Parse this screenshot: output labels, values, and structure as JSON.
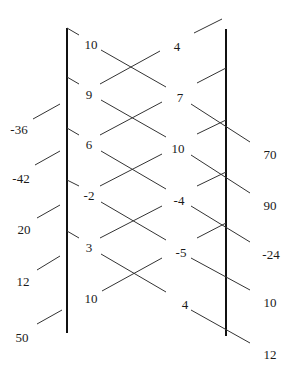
{
  "diagram": {
    "type": "number-chain-crossing",
    "colors": {
      "axis": "#111111",
      "segment": "#333333",
      "text": "#1a1a1a"
    },
    "left_axis": {
      "x": 67,
      "y1": 28,
      "y2": 333
    },
    "right_axis": {
      "x": 226,
      "y1": 29,
      "y2": 336
    },
    "left_inner_labels": [
      {
        "text": "10",
        "x": 91,
        "y": 46
      },
      {
        "text": "9",
        "x": 89,
        "y": 96
      },
      {
        "text": "6",
        "x": 89,
        "y": 146
      },
      {
        "text": "-2",
        "x": 89,
        "y": 197
      },
      {
        "text": "3",
        "x": 89,
        "y": 249
      },
      {
        "text": "10",
        "x": 91,
        "y": 300
      }
    ],
    "right_inner_labels": [
      {
        "text": "4",
        "x": 177,
        "y": 48
      },
      {
        "text": "7",
        "x": 180,
        "y": 99
      },
      {
        "text": "10",
        "x": 178,
        "y": 150
      },
      {
        "text": "-4",
        "x": 179,
        "y": 202
      },
      {
        "text": "-5",
        "x": 181,
        "y": 254
      },
      {
        "text": "4",
        "x": 185,
        "y": 306
      }
    ],
    "left_outer_labels": [
      {
        "text": "-36",
        "x": 19,
        "y": 131
      },
      {
        "text": "-42",
        "x": 21,
        "y": 180
      },
      {
        "text": "20",
        "x": 24,
        "y": 231
      },
      {
        "text": "12",
        "x": 23,
        "y": 283
      },
      {
        "text": "50",
        "x": 22,
        "y": 339
      }
    ],
    "right_outer_labels": [
      {
        "text": "70",
        "x": 270,
        "y": 156
      },
      {
        "text": "90",
        "x": 270,
        "y": 207
      },
      {
        "text": "-24",
        "x": 271,
        "y": 256
      },
      {
        "text": "10",
        "x": 270,
        "y": 304
      },
      {
        "text": "12",
        "x": 270,
        "y": 356
      }
    ],
    "segments": [
      [
        67,
        28,
        79,
        35
      ],
      [
        101,
        50,
        166,
        87
      ],
      [
        191,
        104,
        250,
        142
      ],
      [
        67,
        77,
        79,
        84
      ],
      [
        101,
        100,
        166,
        137
      ],
      [
        191,
        155,
        250,
        193
      ],
      [
        67,
        128,
        79,
        135
      ],
      [
        101,
        151,
        166,
        189
      ],
      [
        191,
        206,
        250,
        242
      ],
      [
        67,
        180,
        79,
        186
      ],
      [
        101,
        202,
        166,
        240
      ],
      [
        191,
        258,
        250,
        290
      ],
      [
        67,
        231,
        79,
        238
      ],
      [
        101,
        254,
        166,
        292
      ],
      [
        191,
        310,
        250,
        343
      ],
      [
        194,
        33,
        222,
        19
      ],
      [
        160,
        51,
        100,
        84
      ],
      [
        60,
        104,
        33,
        119
      ],
      [
        226,
        68,
        197,
        83
      ],
      [
        162,
        102,
        100,
        135
      ],
      [
        60,
        151,
        35,
        165
      ],
      [
        226,
        120,
        197,
        134
      ],
      [
        162,
        154,
        100,
        186
      ],
      [
        60,
        205,
        37,
        218
      ],
      [
        226,
        172,
        197,
        186
      ],
      [
        162,
        206,
        100,
        238
      ],
      [
        60,
        256,
        37,
        270
      ],
      [
        226,
        223,
        197,
        238
      ],
      [
        162,
        258,
        102,
        291
      ],
      [
        62,
        310,
        37,
        324
      ]
    ]
  }
}
